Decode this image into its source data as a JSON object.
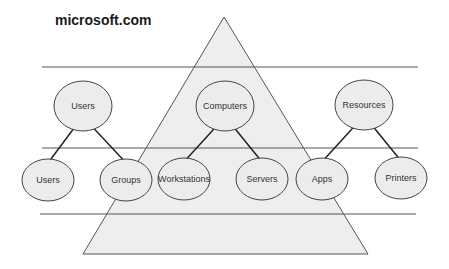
{
  "title": "microsoft.com",
  "colors": {
    "line": "#555555",
    "triangle_fill": "#eeeeee",
    "node_fill": "#ececec",
    "node_stroke": "#444444",
    "text": "#333333"
  },
  "layers": [
    {
      "y": 67,
      "x1": 42,
      "x2": 418
    },
    {
      "y": 148,
      "x1": 42,
      "x2": 418
    },
    {
      "y": 214,
      "x1": 40,
      "x2": 416
    }
  ],
  "triangle": {
    "apex": [
      224,
      17
    ],
    "base_left": [
      83,
      254
    ],
    "base_right": [
      368,
      254
    ]
  },
  "groups": [
    {
      "parent": {
        "label": "Users",
        "cx": 83,
        "cy": 106,
        "rx": 29,
        "ry": 25
      },
      "children": [
        {
          "label": "Users",
          "cx": 48,
          "cy": 180,
          "rx": 26,
          "ry": 21
        },
        {
          "label": "Groups",
          "cx": 126,
          "cy": 180,
          "rx": 26,
          "ry": 21
        }
      ]
    },
    {
      "parent": {
        "label": "Computers",
        "cx": 225,
        "cy": 106,
        "rx": 29,
        "ry": 25
      },
      "children": [
        {
          "label": "Workstations",
          "cx": 184,
          "cy": 179,
          "rx": 26,
          "ry": 21
        },
        {
          "label": "Servers",
          "cx": 262,
          "cy": 179,
          "rx": 26,
          "ry": 21
        }
      ]
    },
    {
      "parent": {
        "label": "Resources",
        "cx": 364,
        "cy": 105,
        "rx": 29,
        "ry": 25
      },
      "children": [
        {
          "label": "Apps",
          "cx": 322,
          "cy": 179,
          "rx": 26,
          "ry": 21
        },
        {
          "label": "Printers",
          "cx": 401,
          "cy": 178,
          "rx": 26,
          "ry": 21
        }
      ]
    }
  ]
}
